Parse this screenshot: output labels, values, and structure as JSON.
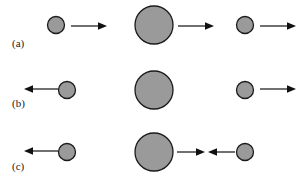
{
  "figure": {
    "title": "",
    "background_color": "#ffffff",
    "ball_fill_color": "#9a9a9a",
    "ball_stroke_color": "#1a1a1a",
    "arrow_color": "#111111",
    "width": 305,
    "height": 179
  },
  "rows": [
    {
      "label": "(a)",
      "label_x": 12,
      "label_y": 47,
      "center_y": 25,
      "objects": [
        {
          "name": "small-ball-left",
          "kind": "circle",
          "cx": 56,
          "cy": 25,
          "r": 8.5
        },
        {
          "name": "arrow-right-small-left",
          "kind": "arrow",
          "direction": "right",
          "x1": 71,
          "x2": 107,
          "y": 26
        },
        {
          "name": "large-ball-center",
          "kind": "circle",
          "cx": 154,
          "cy": 25,
          "r": 19
        },
        {
          "name": "arrow-right-large-center",
          "kind": "arrow",
          "direction": "right",
          "x1": 178,
          "x2": 214,
          "y": 26
        },
        {
          "name": "small-ball-right",
          "kind": "circle",
          "cx": 245,
          "cy": 25,
          "r": 8.5
        },
        {
          "name": "arrow-right-small-right",
          "kind": "arrow",
          "direction": "right",
          "x1": 260,
          "x2": 296,
          "y": 26
        }
      ]
    },
    {
      "label": "(b)",
      "label_x": 12,
      "label_y": 107,
      "center_y": 90,
      "objects": [
        {
          "name": "arrow-left-small-left",
          "kind": "arrow",
          "direction": "left",
          "x1": 24,
          "x2": 58,
          "y": 89
        },
        {
          "name": "small-ball-left",
          "kind": "circle",
          "cx": 67,
          "cy": 90,
          "r": 8.5
        },
        {
          "name": "large-ball-center",
          "kind": "circle",
          "cx": 154,
          "cy": 90,
          "r": 19
        },
        {
          "name": "small-ball-right",
          "kind": "circle",
          "cx": 245,
          "cy": 90,
          "r": 8.5
        },
        {
          "name": "arrow-right-small-right",
          "kind": "arrow",
          "direction": "right",
          "x1": 260,
          "x2": 296,
          "y": 89
        }
      ]
    },
    {
      "label": "(c)",
      "label_x": 12,
      "label_y": 170,
      "center_y": 152,
      "objects": [
        {
          "name": "arrow-left-small-left",
          "kind": "arrow",
          "direction": "left",
          "x1": 24,
          "x2": 58,
          "y": 151
        },
        {
          "name": "small-ball-left",
          "kind": "circle",
          "cx": 67,
          "cy": 152,
          "r": 8.5
        },
        {
          "name": "large-ball-center",
          "kind": "circle",
          "cx": 154,
          "cy": 152,
          "r": 19
        },
        {
          "name": "arrow-right-large-center",
          "kind": "arrow",
          "direction": "right",
          "x1": 177,
          "x2": 205,
          "y": 152
        },
        {
          "name": "arrow-left-small-right",
          "kind": "arrow",
          "direction": "left",
          "x1": 208,
          "x2": 235,
          "y": 152
        },
        {
          "name": "small-ball-right",
          "kind": "circle",
          "cx": 245,
          "cy": 152,
          "r": 8.5
        }
      ]
    }
  ]
}
